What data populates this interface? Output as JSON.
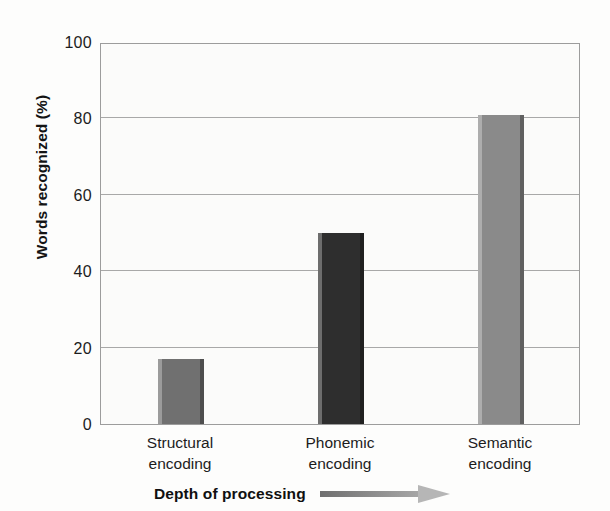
{
  "chart_data": {
    "type": "bar",
    "title": "",
    "subtitle": "",
    "xlabel": "Depth of processing",
    "ylabel": "Words recognized (%)",
    "categories": [
      "Structural encoding",
      "Phonemic encoding",
      "Semantic encoding"
    ],
    "category_lines": [
      [
        "Structural",
        "encoding"
      ],
      [
        "Phonemic",
        "encoding"
      ],
      [
        "Semantic",
        "encoding"
      ]
    ],
    "values": [
      17,
      50,
      81
    ],
    "ylim": [
      0,
      100
    ],
    "yticks": [
      0,
      20,
      40,
      60,
      80,
      100
    ],
    "ytick_labels": [
      "0",
      "20",
      "40",
      "60",
      "80",
      "100"
    ],
    "grid": true,
    "legend": "none",
    "bar_colors": [
      "#707070",
      "#2e2e2e",
      "#8a8a8a"
    ],
    "annotations": [
      {
        "name": "direction-arrow",
        "text": "",
        "description": "right-pointing gradient arrow following the x-axis caption"
      }
    ]
  },
  "axis": {
    "y_title": "Words recognized (%)",
    "x_caption": "Depth of processing"
  },
  "colors": {
    "background": "#fdfdfc",
    "plot_background": "#fbfbfa",
    "axis_line": "#9c9c9c",
    "grid_line": "#a8a8a8",
    "text": "#1c1c1c",
    "arrow_start": "#6f6f6f",
    "arrow_end": "#b6b6b6"
  }
}
